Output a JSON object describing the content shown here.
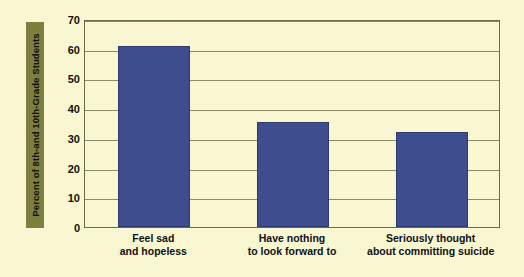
{
  "chart_data": {
    "type": "bar",
    "title": "",
    "subtitle": "",
    "xlabel": "",
    "ylabel": "Percent of 8th-and 10th-Grade Students",
    "categories": [
      "Feel sad\nand hopeless",
      "Have nothing\nto look forward to",
      "Seriously thought\nabout committing suicide"
    ],
    "category_lines": [
      [
        "Feel sad",
        "and hopeless"
      ],
      [
        "Have nothing",
        "to look forward to"
      ],
      [
        "Seriously thought",
        "about committing suicide"
      ]
    ],
    "values": [
      61,
      35.5,
      32
    ],
    "ylim": [
      0,
      70
    ],
    "yticks": [
      0,
      10,
      20,
      30,
      40,
      50,
      60,
      70
    ],
    "ytick_labels": [
      "0",
      "10",
      "20",
      "30",
      "40",
      "50",
      "60",
      "70"
    ],
    "grid": true,
    "legend": false,
    "legend_position": "none",
    "bar_color": "#3e4d8e",
    "bar_edge_color": "#2e3a6e",
    "background_color": "#f9f6d2",
    "axis_color": "#6b6a47",
    "gridline_color": "#8a8a62",
    "ylabel_box_color": "#7d7f3f",
    "text_color": "#111111"
  }
}
